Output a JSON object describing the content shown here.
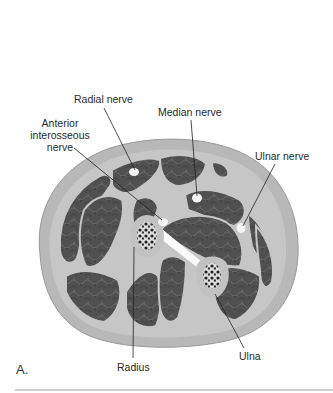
{
  "figure": {
    "panel_letter": "A.",
    "labels": {
      "radial_nerve": "Radial nerve",
      "median_nerve": "Median nerve",
      "anterior_interosseous_line1": "Anterior",
      "anterior_interosseous_line2": "interosseous",
      "anterior_interosseous_line3": "nerve",
      "ulnar_nerve": "Ulnar nerve",
      "radius": "Radius",
      "ulna": "Ulna"
    }
  },
  "colors": {
    "skin": "#b5b5b5",
    "fascia": "#c8c8c8",
    "muscle": "#555555",
    "nerve": "#f2f2f2",
    "leader_line": "#222222",
    "separator": "#cfcfcf"
  }
}
